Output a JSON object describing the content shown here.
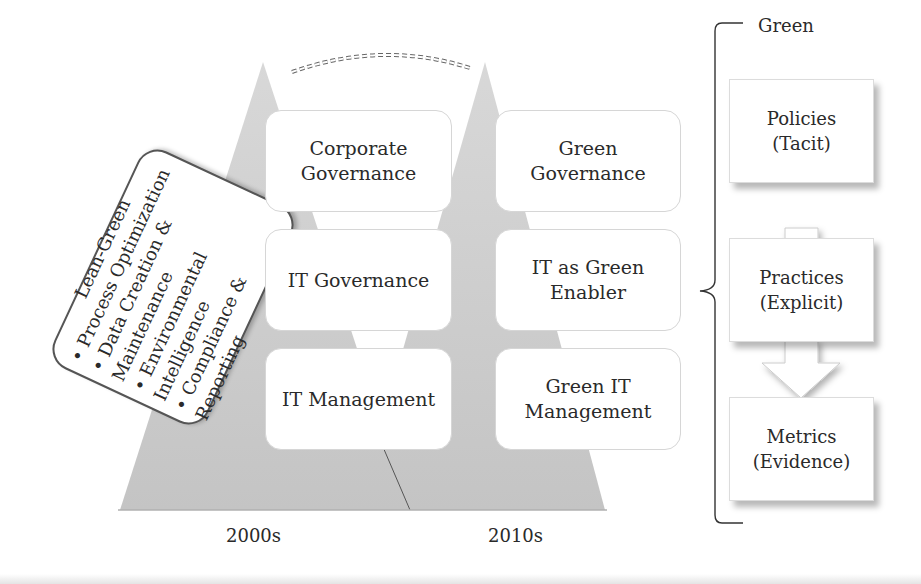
{
  "diagram": {
    "dashed_arc": "curved dashed arrow between 2000s and 2010s peaks",
    "eras": [
      {
        "label": "2000s",
        "boxes": [
          "Corporate Governance",
          "IT Governance",
          "IT Management"
        ],
        "box_lines": [
          [
            "Corporate",
            "Governance"
          ],
          [
            "IT Governance"
          ],
          [
            "IT Management"
          ]
        ]
      },
      {
        "label": "2010s",
        "boxes": [
          "Green Governance",
          "IT as Green Enabler",
          "Green IT Management"
        ],
        "box_lines": [
          [
            "Green",
            "Governance"
          ],
          [
            "IT as Green",
            "Enabler"
          ],
          [
            "Green IT",
            "Management"
          ]
        ]
      }
    ],
    "lean_green": {
      "title": "Lean-Green",
      "bullets": [
        "Process Optimization",
        "Data Creation & Maintenance",
        "Environmental Intelligence",
        "Compliance & Reporting"
      ]
    },
    "green_bracket": {
      "label": "Green",
      "steps": [
        {
          "title": "Policies",
          "sub": "(Tacit)"
        },
        {
          "title": "Practices",
          "sub": "(Explicit)"
        },
        {
          "title": "Metrics",
          "sub": "(Evidence)"
        }
      ]
    },
    "colors": {
      "triangle": "#c9c9c9",
      "box_border": "#d6d6d6",
      "text": "#2a2a2a",
      "line": "#333333"
    }
  }
}
